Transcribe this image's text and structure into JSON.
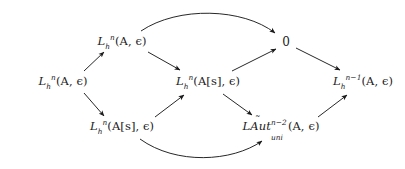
{
  "figure": {
    "kind": "commutative-diagram",
    "background_color": "#ffffff",
    "ink_color": "#1b1b1b",
    "width": 405,
    "height": 169
  },
  "nodes": {
    "left": {
      "id": "L-left",
      "label": "L_h^n(A, ϵ)",
      "parts": {
        "L": "L",
        "sub": "h",
        "sup": "n",
        "args": "(A, ϵ)"
      },
      "x": 63,
      "y": 82
    },
    "top_left": {
      "id": "L-top-left",
      "label": "L_h^n(A, ϵ)",
      "parts": {
        "L": "L",
        "sub": "h",
        "sup": "n",
        "args": "(A, ϵ)"
      },
      "x": 122,
      "y": 42
    },
    "bottom_left": {
      "id": "L-bottom-left",
      "label": "L_h^n(A[s], ϵ)",
      "parts": {
        "L": "L",
        "sub": "h",
        "sup": "n",
        "args": "(A[s], ϵ)"
      },
      "x": 122,
      "y": 127
    },
    "center": {
      "id": "L-center",
      "label": "L_h^n(A[s], ϵ)",
      "parts": {
        "L": "L",
        "sub": "h",
        "sup": "n",
        "args": "(A[s], ϵ)"
      },
      "x": 208,
      "y": 82
    },
    "zero": {
      "id": "zero",
      "label": "0",
      "x": 286,
      "y": 42
    },
    "laut": {
      "id": "LAut-uni",
      "label": "LÃut_uni^{n-2}(A, ϵ)",
      "parts": {
        "L": "L",
        "accented": "Aut",
        "accent": "̃",
        "sub": "uni",
        "sup": "n−2",
        "args": "(A, ϵ)"
      },
      "x": 281,
      "y": 127
    },
    "right": {
      "id": "L-right",
      "label": "L_h^{n-1}(A, ϵ)",
      "parts": {
        "L": "L",
        "sub": "h",
        "sup": "n−1",
        "args": "(A, ϵ)"
      },
      "x": 363,
      "y": 82
    }
  },
  "edges": [
    {
      "name": "left-to-top-left",
      "from": "left",
      "to": "top_left",
      "style": "straight"
    },
    {
      "name": "left-to-bottom-left",
      "from": "left",
      "to": "bottom_left",
      "style": "straight"
    },
    {
      "name": "top-left-to-center",
      "from": "top_left",
      "to": "center",
      "style": "straight"
    },
    {
      "name": "bottom-left-to-center",
      "from": "bottom_left",
      "to": "center",
      "style": "straight"
    },
    {
      "name": "top-left-to-zero",
      "from": "top_left",
      "to": "zero",
      "style": "curved-over"
    },
    {
      "name": "center-to-zero",
      "from": "center",
      "to": "zero",
      "style": "straight"
    },
    {
      "name": "center-to-laut",
      "from": "center",
      "to": "laut",
      "style": "straight"
    },
    {
      "name": "bottom-left-to-laut",
      "from": "bottom_left",
      "to": "laut",
      "style": "curved-under"
    },
    {
      "name": "zero-to-right",
      "from": "zero",
      "to": "right",
      "style": "straight"
    },
    {
      "name": "laut-to-right",
      "from": "laut",
      "to": "right",
      "style": "straight"
    }
  ]
}
